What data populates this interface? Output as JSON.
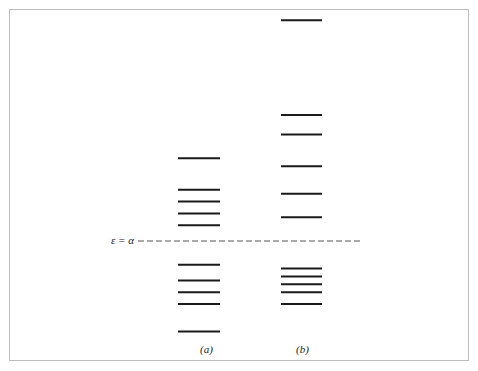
{
  "diagram": {
    "type": "energy-level diagram",
    "reference_line_label": "ε = α",
    "columns": [
      {
        "label": "(a)",
        "levels_above": 5,
        "levels_below": 5
      },
      {
        "label": "(b)",
        "levels_above": 6,
        "levels_below": 5
      }
    ]
  },
  "chart_data": {
    "type": "scatter",
    "title": "",
    "xlabel": "",
    "ylabel": "",
    "reference_line": {
      "label": "ε = α",
      "style": "dashed"
    },
    "series": [
      {
        "name": "(a)",
        "relative_energies": [
          2.1,
          1.3,
          1.0,
          0.7,
          0.4,
          -0.6,
          -1.0,
          -1.3,
          -1.6,
          -2.3
        ]
      },
      {
        "name": "(b)",
        "relative_energies": [
          5.6,
          3.2,
          2.7,
          1.9,
          1.2,
          0.6,
          -0.7,
          -0.9,
          -1.1,
          -1.3,
          -1.6
        ]
      }
    ]
  }
}
